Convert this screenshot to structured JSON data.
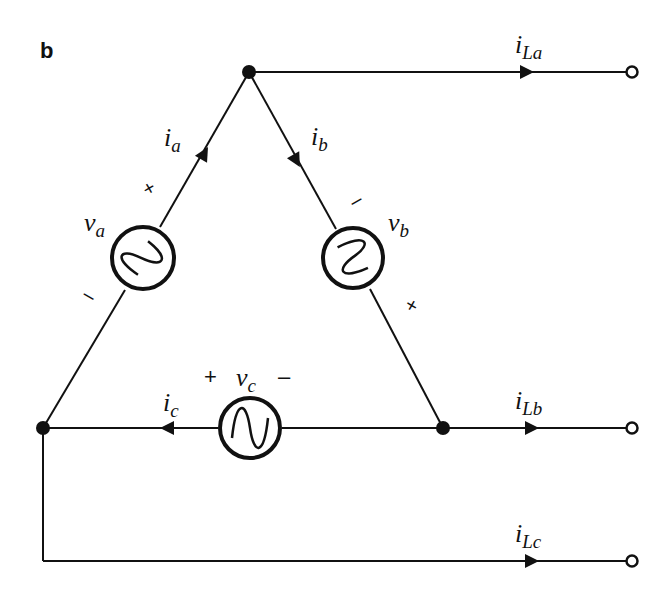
{
  "figure": {
    "panel_label": "b"
  },
  "sources": [
    {
      "id": "va",
      "symbol": "v",
      "subscript": "a",
      "plus": "+",
      "minus": "–",
      "branch_current": {
        "symbol": "i",
        "subscript": "a"
      }
    },
    {
      "id": "vb",
      "symbol": "v",
      "subscript": "b",
      "plus": "+",
      "minus": "–",
      "branch_current": {
        "symbol": "i",
        "subscript": "b"
      }
    },
    {
      "id": "vc",
      "symbol": "v",
      "subscript": "c",
      "plus": "+",
      "minus": "–",
      "branch_current": {
        "symbol": "i",
        "subscript": "c"
      }
    }
  ],
  "line_currents": [
    {
      "symbol": "i",
      "subscript": "La"
    },
    {
      "symbol": "i",
      "subscript": "Lb"
    },
    {
      "symbol": "i",
      "subscript": "Lc"
    }
  ],
  "colors": {
    "stroke": "#111111",
    "background": "#ffffff"
  }
}
